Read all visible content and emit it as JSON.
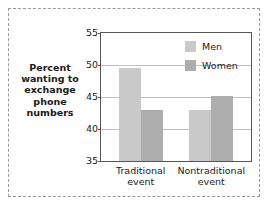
{
  "chart_data": {
    "type": "bar",
    "title": "",
    "xlabel": "",
    "ylabel": "Percent wanting to exchange phone numbers",
    "ylabel_lines": [
      "Percent",
      "wanting to",
      "exchange",
      "phone",
      "numbers"
    ],
    "categories": [
      "Traditional event",
      "Nontraditional event"
    ],
    "category_lines": [
      [
        "Traditional",
        "event"
      ],
      [
        "Nontraditional",
        "event"
      ]
    ],
    "series": [
      {
        "name": "Men",
        "values": [
          49.5,
          43.0
        ],
        "color": "#c9c9c9"
      },
      {
        "name": "Women",
        "values": [
          43.0,
          45.2
        ],
        "color": "#adadad"
      }
    ],
    "ylim": [
      35,
      55
    ],
    "yticks": [
      35,
      40,
      45,
      50,
      55
    ],
    "ytick_labels": [
      "35",
      "40",
      "45",
      "50",
      "55"
    ],
    "grid": true,
    "grid_axis": "y",
    "legend_position": "top-right",
    "frame": true,
    "outer_border": "dashed"
  },
  "legend": {
    "entries": [
      {
        "label": "Men"
      },
      {
        "label": "Women"
      }
    ]
  }
}
